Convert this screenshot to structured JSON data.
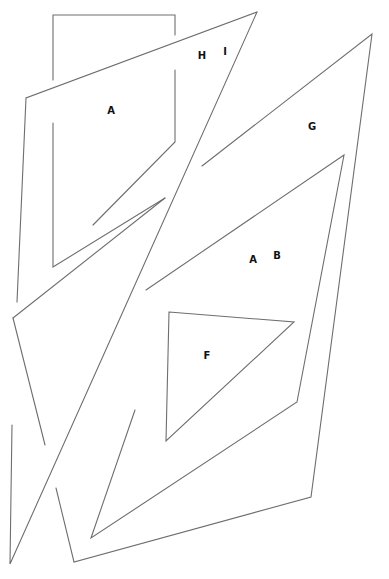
{
  "diagram": {
    "width": 389,
    "height": 579,
    "stroke_color": "#6e6e6e",
    "background": "#ffffff",
    "labels": [
      {
        "id": "label-a-top",
        "text": "A",
        "x": 111,
        "y": 111
      },
      {
        "id": "label-h",
        "text": "H",
        "x": 202,
        "y": 56
      },
      {
        "id": "label-i",
        "text": "I",
        "x": 225,
        "y": 52
      },
      {
        "id": "label-g",
        "text": "G",
        "x": 312,
        "y": 127
      },
      {
        "id": "label-a-mid",
        "text": "A",
        "x": 253,
        "y": 260
      },
      {
        "id": "label-b",
        "text": "B",
        "x": 277,
        "y": 256
      },
      {
        "id": "label-f",
        "text": "F",
        "x": 207,
        "y": 356
      }
    ],
    "shapes": [
      {
        "id": "rect-top-left",
        "points": "53,36 53,80 M53,123 53,267 165,198 M53,36 175,36 175,70 M175,109 175,133"
      },
      {
        "id": "quad-a",
        "points": "22,308 26,98 257,12"
      },
      {
        "id": "triangle-hi",
        "points": "257,12 10,564 22,308"
      },
      {
        "id": "shape-g",
        "points": "372,34 311,497 74,562 57,487"
      },
      {
        "id": "triangle-ab",
        "points": "344,155 297,402 91,538 135,408"
      },
      {
        "id": "triangle-f",
        "points": "169,312 294,322 166,441 169,312"
      }
    ]
  }
}
